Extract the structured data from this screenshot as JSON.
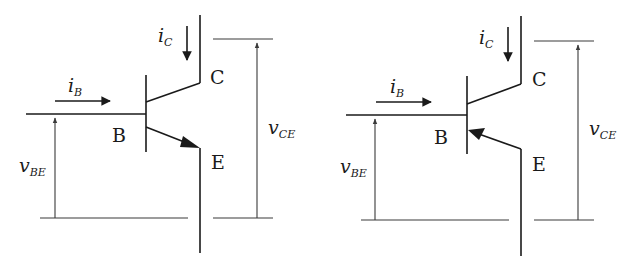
{
  "diagrams": [
    {
      "type": "NPN transistor",
      "terminals": {
        "base": "B",
        "collector": "C",
        "emitter": "E"
      },
      "currents": {
        "ib": {
          "main": "i",
          "sub": "B"
        },
        "ic": {
          "main": "i",
          "sub": "C"
        }
      },
      "voltages": {
        "vbe": {
          "main": "v",
          "sub": "BE"
        },
        "vce": {
          "main": "v",
          "sub": "CE"
        }
      }
    },
    {
      "type": "PNP transistor",
      "terminals": {
        "base": "B",
        "collector": "C",
        "emitter": "E"
      },
      "currents": {
        "ib": {
          "main": "i",
          "sub": "B"
        },
        "ic": {
          "main": "i",
          "sub": "C"
        }
      },
      "voltages": {
        "vbe": {
          "main": "v",
          "sub": "BE"
        },
        "vce": {
          "main": "v",
          "sub": "CE"
        }
      }
    }
  ],
  "colors": {
    "line": "#1a1a1a",
    "background": "#ffffff"
  }
}
